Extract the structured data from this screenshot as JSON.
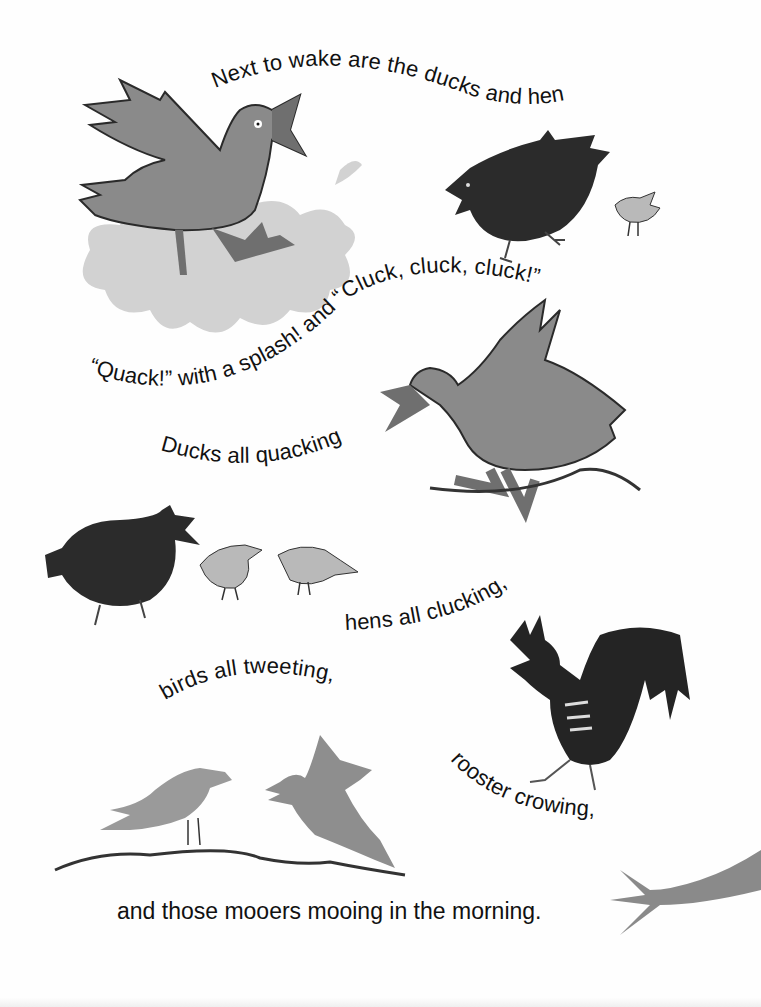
{
  "page": {
    "background": "#fefefe",
    "colors": {
      "text": "#111111",
      "duck": "#8a8a8a",
      "duck_outline": "#2a2a2a",
      "beak": "#6f6f6f",
      "splash": "#d2d2d2",
      "hen": "#2b2b2b",
      "chick": "#b9b9b9",
      "rooster": "#242424",
      "songbird": "#8e8e8e",
      "branch": "#333333",
      "cow_tail": "#8a8a8a"
    }
  },
  "verses": [
    {
      "id": "line1",
      "text": "Next to wake are the ducks and hens—"
    },
    {
      "id": "line2",
      "text": "“Quack!” with a splash! and “Cluck, cluck, cluck!”"
    },
    {
      "id": "line3",
      "text": "Ducks all quacking,"
    },
    {
      "id": "line4",
      "text": "hens all clucking,"
    },
    {
      "id": "line5",
      "text": "birds all tweeting,"
    },
    {
      "id": "line6",
      "text": "rooster crowing,"
    },
    {
      "id": "line7",
      "text": "and those mooers mooing in the morning."
    }
  ],
  "illustrations": [
    {
      "name": "duck-splashing",
      "description": "gray duck with open beak above a light gray splash"
    },
    {
      "name": "hen-with-chick",
      "description": "dark hen walking followed by a small light chick"
    },
    {
      "name": "duck-on-ground",
      "description": "gray duck with raised wings walking on a wavy line"
    },
    {
      "name": "hen-with-two-chicks",
      "description": "dark hen clucking with two light chicks"
    },
    {
      "name": "rooster",
      "description": "dark rooster with long tail feathers, crowing"
    },
    {
      "name": "two-songbirds",
      "description": "two gray birds tweeting on a wavy branch"
    },
    {
      "name": "cow-tail",
      "description": "gray cow tail tip entering from right edge"
    }
  ]
}
